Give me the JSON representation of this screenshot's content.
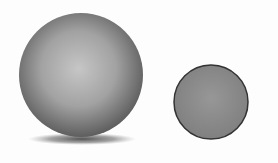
{
  "figure": {
    "background": "#fdfdfd",
    "objects": [
      {
        "name": "large-sphere",
        "shape": "sphere",
        "center": [
          81,
          76
        ],
        "radius": 62,
        "shading": "radial-gradient",
        "highlight_color": "#c4c4c4",
        "edge_color": "#5e5e5e",
        "has_shadow": true,
        "shadow_color": "#555555"
      },
      {
        "name": "small-circle",
        "shape": "circle",
        "center": [
          211,
          102
        ],
        "radius": 37,
        "fill_color": "#8c8c8c",
        "outline_color": "#333333",
        "has_shadow": false
      }
    ]
  }
}
